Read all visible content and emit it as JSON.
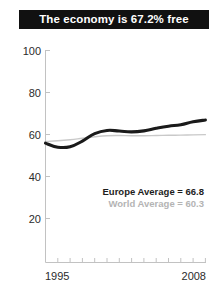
{
  "title": {
    "text": "The economy is 67.2% free"
  },
  "legend": {
    "europe_label": "Europe Average = 66.8",
    "world_label": "World Average = 60.3"
  },
  "axes": {
    "y_ticks": [
      "100",
      "80",
      "60",
      "40",
      "20"
    ],
    "x_start_label": "1995",
    "x_end_label": "2008"
  },
  "colors": {
    "title_bar_bg": "#111111",
    "title_text": "#ffffff",
    "europe_line": "#1a1a1a",
    "world_line": "#c9c9c9",
    "axis": "#bfbfbf",
    "tick_text": "#2b2b2b",
    "legend_europe_text": "#1d1d1d",
    "legend_world_text": "#b4b4b4"
  },
  "chart_data": {
    "type": "line",
    "title": "The economy is 67.2% free",
    "xlabel": "",
    "ylabel": "",
    "xlim": [
      1995,
      2008
    ],
    "ylim": [
      0,
      100
    ],
    "yticks": [
      20,
      40,
      60,
      80,
      100
    ],
    "xticks": [
      1995,
      1996,
      1997,
      1998,
      1999,
      2000,
      2001,
      2002,
      2003,
      2004,
      2005,
      2006,
      2007,
      2008
    ],
    "xtick_labels_shown": [
      "1995",
      "2008"
    ],
    "grid": false,
    "legend_position": "inside-lower-right",
    "x": [
      1995,
      1996,
      1997,
      1998,
      1999,
      2000,
      2001,
      2002,
      2003,
      2004,
      2005,
      2006,
      2007,
      2008
    ],
    "series": [
      {
        "name": "Europe Average",
        "style": "thick-dark",
        "average": 66.8,
        "values": [
          56.3,
          54.4,
          54.6,
          57.3,
          60.8,
          62.3,
          62.0,
          61.6,
          62.1,
          63.3,
          64.3,
          65.0,
          66.4,
          67.2
        ]
      },
      {
        "name": "World Average",
        "style": "thin-gray",
        "average": 60.3,
        "values": [
          57.1,
          57.4,
          57.9,
          58.6,
          59.3,
          59.8,
          59.9,
          59.8,
          59.8,
          59.9,
          60.0,
          60.1,
          60.2,
          60.3
        ]
      }
    ],
    "annotations": [
      {
        "text": "Europe Average = 66.8",
        "emphasis": "bold-dark"
      },
      {
        "text": "World Average = 60.3",
        "emphasis": "bold-light"
      }
    ]
  }
}
